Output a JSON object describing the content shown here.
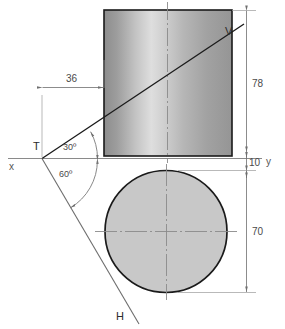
{
  "drawing": {
    "title": "Oblique cylinder projection",
    "background_color": "#ffffff",
    "outline_color": "#1a1a1a",
    "thin_line_color": "#8c8c8c",
    "circle_fill_color": "#c8c8c8",
    "gradient": {
      "stop_left_color": "#8e8e8e",
      "stop_mid_color": "#dcdcdc",
      "stop_right_color": "#979797"
    }
  },
  "labels": {
    "point_t": "T",
    "point_v": "V",
    "point_h": "H",
    "axis_x": "x",
    "axis_y": "y"
  },
  "dimensions": {
    "width_36": "36",
    "height_78": "78",
    "gap_10": "10",
    "diameter_70": "70"
  },
  "angles": {
    "upper": "30º",
    "lower": "60º"
  }
}
